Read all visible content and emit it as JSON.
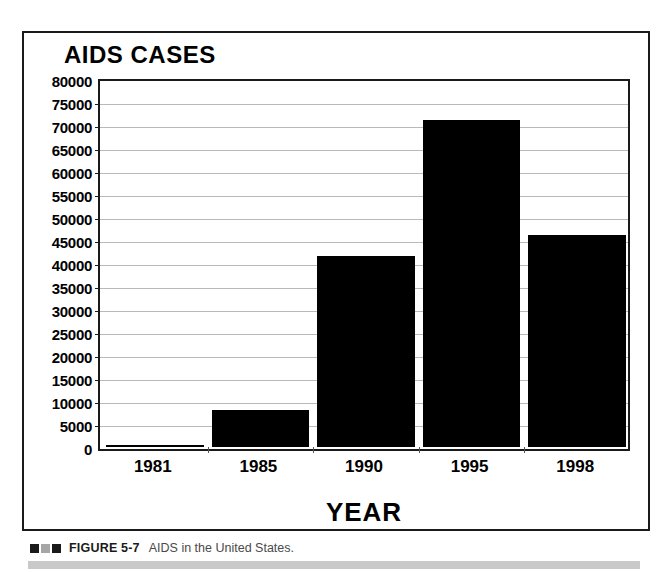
{
  "figure": {
    "caption_label": "FIGURE 5-7",
    "caption_text": "AIDS in the United States.",
    "caption_marks": [
      "dark",
      "gray",
      "dark"
    ]
  },
  "chart_data": {
    "type": "bar",
    "title": "AIDS CASES",
    "xlabel": "YEAR",
    "ylabel": "",
    "categories": [
      "1981",
      "1985",
      "1990",
      "1995",
      "1998"
    ],
    "values": [
      300,
      8000,
      41500,
      71000,
      46000
    ],
    "ylim": [
      0,
      80000
    ],
    "ytick_step": 5000,
    "yticks": [
      0,
      5000,
      10000,
      15000,
      20000,
      25000,
      30000,
      35000,
      40000,
      45000,
      50000,
      55000,
      60000,
      65000,
      70000,
      75000,
      80000
    ],
    "ytick_labels": [
      "0",
      "5000",
      "10000",
      "15000",
      "20000",
      "25000",
      "30000",
      "35000",
      "40000",
      "45000",
      "50000",
      "55000",
      "60000",
      "65000",
      "70000",
      "75000",
      "80000"
    ],
    "grid": true,
    "legend": null,
    "bar_color": "#000000",
    "grid_color": "#b9b9b9",
    "axis_color": "#1a1a1a"
  }
}
